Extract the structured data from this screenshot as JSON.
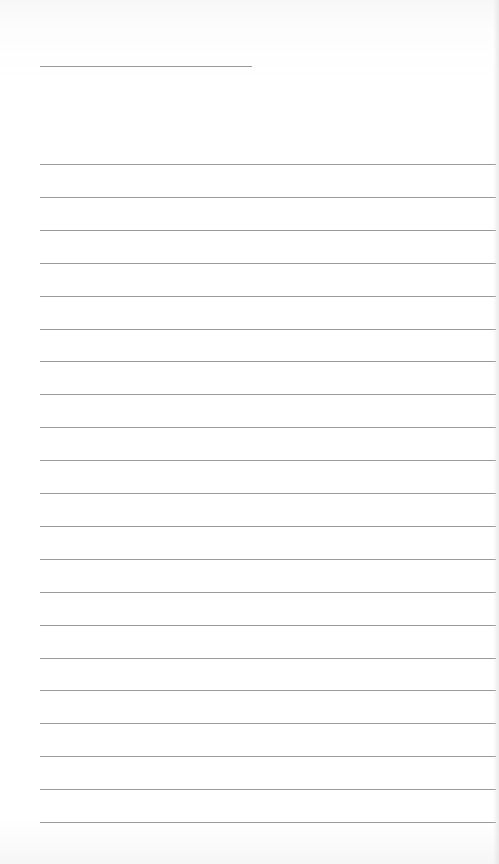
{
  "document": {
    "type": "lined-paper",
    "title_line": {
      "x": 40,
      "y": 66,
      "width": 212,
      "text": ""
    },
    "ruled_lines": {
      "count": 21,
      "start_y": 164,
      "spacing": 32.9,
      "x": 40,
      "width": 456
    },
    "line_color": "#9a9a9a",
    "background_color": "#ffffff"
  }
}
